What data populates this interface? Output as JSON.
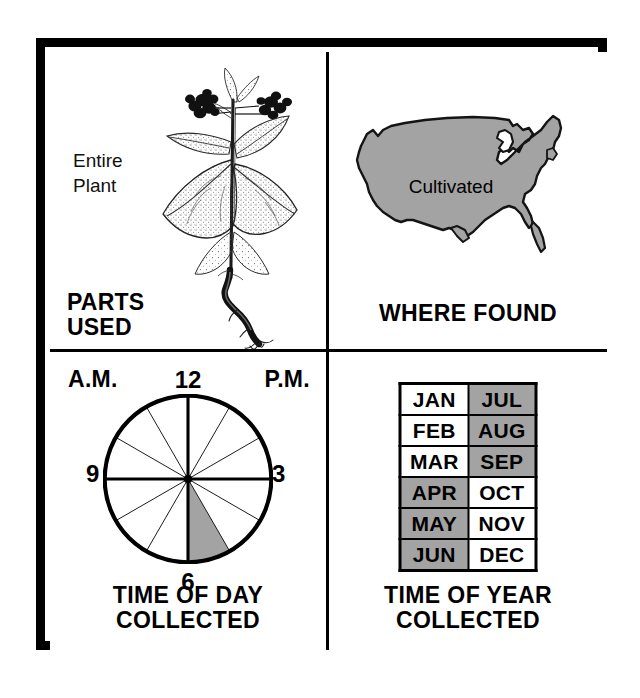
{
  "figure": {
    "type": "herb-profile-infographic",
    "colors": {
      "shaded": "#a3a3a3",
      "ink": "#000000",
      "paper": "#ffffff"
    }
  },
  "panels": {
    "parts_used": {
      "caption_line1": "PARTS",
      "caption_line2": "USED",
      "label_line1": "Entire",
      "label_line2": "Plant",
      "illustration": "flowering-plant-with-taproot-line-drawing"
    },
    "where_found": {
      "caption": "WHERE FOUND",
      "map_label": "Cultivated",
      "illustration": "united-states-map-filled-gray"
    },
    "time_of_day": {
      "caption_line1": "TIME OF DAY",
      "caption_line2": "COLLECTED",
      "am_label": "A.M.",
      "pm_label": "P.M.",
      "hour_12": "12",
      "hour_3": "3",
      "hour_6": "6",
      "hour_9": "9",
      "illustration": "clock-dial-12-sectors-one-shaded"
    },
    "time_of_year": {
      "caption_line1": "TIME OF YEAR",
      "caption_line2": "COLLECTED",
      "illustration": "two-column-month-grid"
    }
  },
  "chart_data": [
    {
      "type": "pie",
      "name": "time-of-day-collected",
      "title": "TIME OF DAY COLLECTED",
      "annotations": [
        "A.M.",
        "P.M.",
        "12",
        "3",
        "6",
        "9"
      ],
      "sector_count": 12,
      "sector_hours": 1,
      "clock_hours": [
        "12-1",
        "1-2",
        "2-3",
        "3-4",
        "4-5",
        "5-6",
        "6-7",
        "7-8",
        "8-9",
        "9-10",
        "10-11",
        "11-12"
      ],
      "shaded_sectors": [
        "5-6 P.M."
      ],
      "shaded_start_deg": 150,
      "shaded_end_deg": 180,
      "shaded_color": "#a3a3a3",
      "unshaded_color": "#ffffff",
      "legend": "shaded wedge marks the collection hour"
    },
    {
      "type": "table",
      "name": "time-of-year-collected",
      "title": "TIME OF YEAR COLLECTED",
      "columns": 2,
      "rows": 6,
      "cells": [
        [
          {
            "label": "JAN",
            "shaded": false
          },
          {
            "label": "JUL",
            "shaded": true
          }
        ],
        [
          {
            "label": "FEB",
            "shaded": false
          },
          {
            "label": "AUG",
            "shaded": true
          }
        ],
        [
          {
            "label": "MAR",
            "shaded": false
          },
          {
            "label": "SEP",
            "shaded": true
          }
        ],
        [
          {
            "label": "APR",
            "shaded": true
          },
          {
            "label": "OCT",
            "shaded": false
          }
        ],
        [
          {
            "label": "MAY",
            "shaded": true
          },
          {
            "label": "NOV",
            "shaded": false
          }
        ],
        [
          {
            "label": "JUN",
            "shaded": true
          },
          {
            "label": "DEC",
            "shaded": false
          }
        ]
      ],
      "shaded_months": [
        "APR",
        "MAY",
        "JUN",
        "JUL",
        "AUG",
        "SEP"
      ],
      "unshaded_months": [
        "JAN",
        "FEB",
        "MAR",
        "OCT",
        "NOV",
        "DEC"
      ],
      "shaded_color": "#a3a3a3",
      "unshaded_color": "#ffffff"
    },
    {
      "type": "map",
      "name": "where-found",
      "title": "WHERE FOUND",
      "region": "Continental United States",
      "annotation": "Cultivated",
      "fill_color": "#a3a3a3",
      "coverage": "entire-country-shaded"
    }
  ]
}
